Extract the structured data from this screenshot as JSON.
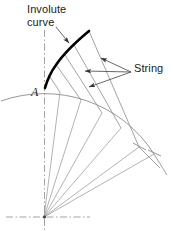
{
  "figure": {
    "type": "engineering-diagram",
    "width": 173,
    "height": 231,
    "background_color": "#ffffff"
  },
  "labels": {
    "involute_line1": "Involute",
    "involute_line2": "curve",
    "string": "String",
    "point_a": "A"
  },
  "colors": {
    "involute_curve": "#000000",
    "base_arc": "#8c8c8c",
    "string_lines": "#8c8c8c",
    "radial_lines": "#9a9a9a",
    "center_line": "#8c8c8c",
    "leader_lines": "#4d4d4d",
    "text": "#1a1a1a"
  },
  "geometry": {
    "center": {
      "x": 44,
      "y": 217
    },
    "base_radius": 130,
    "point_a": {
      "x": 45,
      "y": 88
    },
    "involute_end": {
      "x": 89,
      "y": 31
    },
    "base_arc": {
      "start": {
        "x": 1,
        "y": 101
      },
      "end": {
        "x": 154,
        "y": 154
      },
      "radius": 130
    },
    "involute_curve_points": [
      {
        "x": 45,
        "y": 88
      },
      {
        "x": 50,
        "y": 77
      },
      {
        "x": 57,
        "y": 66
      },
      {
        "x": 65,
        "y": 55
      },
      {
        "x": 74,
        "y": 45
      },
      {
        "x": 82,
        "y": 37
      },
      {
        "x": 89,
        "y": 31
      }
    ],
    "tangent_points": [
      {
        "x": 45,
        "y": 88
      },
      {
        "x": 60,
        "y": 92
      },
      {
        "x": 81,
        "y": 100
      },
      {
        "x": 102,
        "y": 113
      },
      {
        "x": 121,
        "y": 128
      },
      {
        "x": 139,
        "y": 147
      },
      {
        "x": 154,
        "y": 154
      }
    ],
    "string_segments": [
      {
        "from": {
          "x": 60,
          "y": 92
        },
        "to": {
          "x": 50,
          "y": 77
        }
      },
      {
        "from": {
          "x": 81,
          "y": 100
        },
        "to": {
          "x": 57,
          "y": 66
        }
      },
      {
        "from": {
          "x": 102,
          "y": 113
        },
        "to": {
          "x": 65,
          "y": 55
        }
      },
      {
        "from": {
          "x": 121,
          "y": 128
        },
        "to": {
          "x": 74,
          "y": 45
        }
      },
      {
        "from": {
          "x": 139,
          "y": 147
        },
        "to": {
          "x": 89,
          "y": 31
        }
      }
    ],
    "radial_lines_count": 6,
    "leader_lines": [
      {
        "from": {
          "x": 131,
          "y": 72
        },
        "to": {
          "x": 100,
          "y": 58
        }
      },
      {
        "from": {
          "x": 131,
          "y": 72
        },
        "to": {
          "x": 84,
          "y": 71
        }
      },
      {
        "from": {
          "x": 131,
          "y": 72
        },
        "to": {
          "x": 88,
          "y": 88
        }
      },
      {
        "from": {
          "x": 56,
          "y": 27
        },
        "to": {
          "x": 68,
          "y": 42
        }
      }
    ],
    "centerline_vertical": {
      "x": 44,
      "y1": 30,
      "y2": 231
    },
    "centerline_horizontal": {
      "y": 217,
      "x1": 8,
      "x2": 88
    }
  }
}
